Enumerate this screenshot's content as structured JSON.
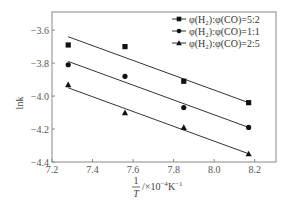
{
  "chart_data": {
    "type": "scatter",
    "title": "",
    "xlabel": "1/T /×10⁻⁴K⁻¹",
    "xlabel_parts": {
      "num": "1",
      "den": "T",
      "unit": "/×10",
      "exp": "−4",
      "unit2": "K",
      "exp2": "−1"
    },
    "ylabel": "lnk",
    "xlim": [
      7.2,
      8.3
    ],
    "ylim": [
      -4.4,
      -3.5
    ],
    "xticks": [
      7.2,
      7.4,
      7.6,
      7.8,
      8.0,
      8.2
    ],
    "xtick_labels": [
      "7.2",
      "7.4",
      "7.6",
      "7.8",
      "8.0",
      "8.2"
    ],
    "yticks": [
      -3.6,
      -3.8,
      -4.0,
      -4.2,
      -4.4
    ],
    "ytick_labels": [
      "−3.6",
      "−3.8",
      "−4.0",
      "−4.2",
      "−4.4"
    ],
    "grid": false,
    "legend_position": "upper right",
    "series": [
      {
        "name": "φ(H₂):φ(CO)=5:2",
        "marker": "square",
        "x": [
          7.28,
          7.56,
          7.85,
          8.17
        ],
        "y": [
          -3.69,
          -3.7,
          -3.91,
          -4.04
        ],
        "fit_line": {
          "x": [
            7.28,
            8.17
          ],
          "y": [
            -3.64,
            -4.04
          ]
        }
      },
      {
        "name": "φ(H₂):φ(CO)=1:1",
        "marker": "circle",
        "x": [
          7.28,
          7.56,
          7.85,
          8.17
        ],
        "y": [
          -3.81,
          -3.88,
          -4.07,
          -4.19
        ],
        "fit_line": {
          "x": [
            7.28,
            8.17
          ],
          "y": [
            -3.79,
            -4.19
          ]
        }
      },
      {
        "name": "φ(H₂):φ(CO)=2:5",
        "marker": "triangle",
        "x": [
          7.28,
          7.56,
          7.85,
          8.17
        ],
        "y": [
          -3.93,
          -4.1,
          -4.19,
          -4.35
        ],
        "fit_line": {
          "x": [
            7.28,
            8.17
          ],
          "y": [
            -3.95,
            -4.35
          ]
        }
      }
    ],
    "colors": {
      "axis": "#888888",
      "marker": "#111111",
      "line": "#333333"
    }
  }
}
